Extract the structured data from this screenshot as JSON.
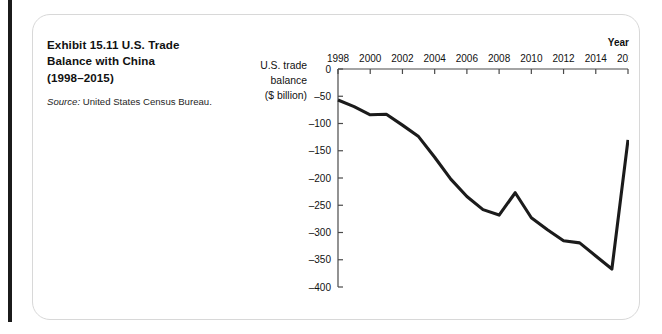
{
  "exhibit": {
    "title_line1": "Exhibit 15.11  U.S. Trade",
    "title_line2": "Balance with China",
    "title_line3": "(1998–2015)",
    "source_label": "Source:",
    "source_text": " United States Census Bureau."
  },
  "axis": {
    "y_title_line1": "U.S. trade",
    "y_title_line2": "balance",
    "y_title_line3": "($ billion)",
    "x_title": "Year"
  },
  "colors": {
    "line": "#1b1b1b",
    "axis": "#4a4a4a",
    "card_border": "#d8d8d8",
    "text": "#111111",
    "page_bar": "#1b1b1b",
    "background": "#ffffff"
  },
  "chart_data": {
    "type": "line",
    "title": "Exhibit 15.11  U.S. Trade Balance with China (1998–2015)",
    "xlabel": "Year",
    "ylabel": "U.S. trade balance ($ billion)",
    "xlim": [
      1998,
      2016
    ],
    "ylim": [
      -400,
      0
    ],
    "xticks": [
      1998,
      2000,
      2002,
      2004,
      2006,
      2008,
      2010,
      2012,
      2014,
      2016
    ],
    "xtick_labels": [
      "1998",
      "2000",
      "2002",
      "2004",
      "2006",
      "2008",
      "2010",
      "2012",
      "2014",
      "2016"
    ],
    "yticks": [
      0,
      -50,
      -100,
      -150,
      -200,
      -250,
      -300,
      -350,
      -400
    ],
    "ytick_labels": [
      "0",
      "–50",
      "–100",
      "–150",
      "–200",
      "–250",
      "–300",
      "–350",
      "–400"
    ],
    "grid": false,
    "legend": false,
    "x": [
      1998,
      1999,
      2000,
      2001,
      2002,
      2003,
      2004,
      2005,
      2006,
      2007,
      2008,
      2009,
      2010,
      2011,
      2012,
      2013,
      2014,
      2015,
      2016
    ],
    "values": [
      -57,
      -69,
      -84,
      -83,
      -103,
      -124,
      -162,
      -202,
      -234,
      -258,
      -268,
      -227,
      -273,
      -295,
      -315,
      -319,
      -343,
      -367,
      -130
    ],
    "series": [
      {
        "name": "U.S. trade balance with China",
        "values": [
          -57,
          -69,
          -84,
          -83,
          -103,
          -124,
          -162,
          -202,
          -234,
          -258,
          -268,
          -227,
          -273,
          -295,
          -315,
          -319,
          -343,
          -367,
          -130
        ]
      }
    ],
    "annotations": []
  }
}
